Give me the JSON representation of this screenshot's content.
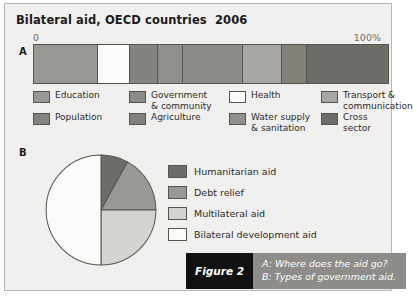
{
  "figure": {
    "title": "Bilateral aid, OECD countries  2006",
    "section_a_label": "A",
    "section_b_label": "B"
  },
  "caption": {
    "number_label": "Figure 2",
    "line_a": "A: Where does the aid go?",
    "line_b": "B: Types of government aid."
  },
  "chart_data": [
    {
      "type": "bar",
      "id": "chart-a",
      "title": "Bilateral aid, OECD countries  2006",
      "subtitle": "A: Where does the aid go?",
      "orientation": "horizontal",
      "stacked": true,
      "normalized_percent": true,
      "xlabel": "",
      "ylabel": "",
      "xlim": [
        0,
        100
      ],
      "axis_min_label": "0",
      "axis_max_label": "100%",
      "grid": false,
      "legend_position": "below",
      "categories": [
        "Education",
        "Health",
        "Population",
        "Water supply & sanitation",
        "Government & community",
        "Transport & communication",
        "Agriculture",
        "Cross sector"
      ],
      "segments": [
        {
          "label": "Education",
          "value": 18,
          "color": "#9a9894"
        },
        {
          "label": "Health",
          "value": 9,
          "color": "#fbfbf9"
        },
        {
          "label": "Population",
          "value": 8,
          "color": "#858380"
        },
        {
          "label": "Water supply & sanitation",
          "value": 7,
          "color": "#918f8b"
        },
        {
          "label": "Government & community",
          "value": 17,
          "color": "#8d8b87"
        },
        {
          "label": "Transport & communication",
          "value": 11,
          "color": "#a9a7a3"
        },
        {
          "label": "Agriculture",
          "value": 7,
          "color": "#828079"
        },
        {
          "label": "Cross sector",
          "value": 23,
          "color": "#6e6c67"
        }
      ],
      "legend": [
        {
          "label": "Education",
          "color": "#9a9894"
        },
        {
          "label": "Health",
          "color": "#fbfbf9"
        },
        {
          "label": "Population",
          "color": "#858380"
        },
        {
          "label": "Water supply\n& sanitation",
          "color": "#918f8b"
        },
        {
          "label": "Government\n& community",
          "color": "#8d8b87"
        },
        {
          "label": "Transport &\ncommunication",
          "color": "#a9a7a3"
        },
        {
          "label": "Agriculture",
          "color": "#828079"
        },
        {
          "label": "Cross sector",
          "color": "#6e6c67"
        }
      ]
    },
    {
      "type": "pie",
      "id": "chart-b",
      "title": "",
      "subtitle": "B: Types of government aid.",
      "start_angle_deg": 0,
      "direction": "clockwise",
      "legend_position": "right",
      "categories": [
        "Humanitarian aid",
        "Debt relief",
        "Multilateral aid",
        "Bilateral development aid"
      ],
      "values": [
        8,
        17,
        25,
        50
      ],
      "slices": [
        {
          "label": "Humanitarian aid",
          "value": 8,
          "color": "#6e6c67"
        },
        {
          "label": "Debt relief",
          "value": 17,
          "color": "#9a9894"
        },
        {
          "label": "Multilateral aid",
          "value": 25,
          "color": "#d6d4d0"
        },
        {
          "label": "Bilateral development aid",
          "value": 50,
          "color": "#fbfbf9"
        }
      ]
    }
  ]
}
